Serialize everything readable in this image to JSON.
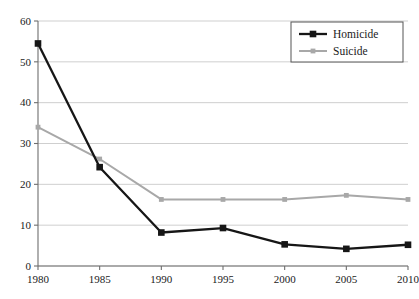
{
  "chart_data": {
    "type": "line",
    "title": "",
    "subtitle": "",
    "xlabel": "",
    "ylabel": "",
    "x": [
      1980,
      1985,
      1990,
      1995,
      2000,
      2005,
      2010
    ],
    "categories": [
      "1980",
      "1985",
      "1990",
      "1995",
      "2000",
      "2005",
      "2010"
    ],
    "xtick_labels": [
      "1980",
      "1985",
      "1990",
      "1995",
      "2000",
      "2005",
      "2010"
    ],
    "ytick_labels": [
      "0",
      "10",
      "20",
      "30",
      "40",
      "50",
      "60"
    ],
    "yticks": [
      0,
      10,
      20,
      30,
      40,
      50,
      60
    ],
    "xlim": [
      1980,
      2010
    ],
    "ylim": [
      0,
      60
    ],
    "grid": true,
    "grid_axis": "y",
    "legend_position": "top-right",
    "series": [
      {
        "name": "Homicide",
        "color": "#161616",
        "marker": "square",
        "values": [
          54.5,
          24.2,
          8.2,
          9.3,
          5.3,
          4.2,
          5.2
        ]
      },
      {
        "name": "Suicide",
        "color": "#a8a8a8",
        "marker": "square",
        "values": [
          34.0,
          26.2,
          16.3,
          16.3,
          16.3,
          17.3,
          16.3
        ]
      }
    ]
  },
  "legend": {
    "entries": [
      {
        "label": "Homicide",
        "color": "#161616"
      },
      {
        "label": "Suicide",
        "color": "#a8a8a8"
      }
    ]
  },
  "axes": {
    "grid_color": "#c9c9c9",
    "axis_color": "#6e6e6e",
    "background": "#ffffff"
  }
}
